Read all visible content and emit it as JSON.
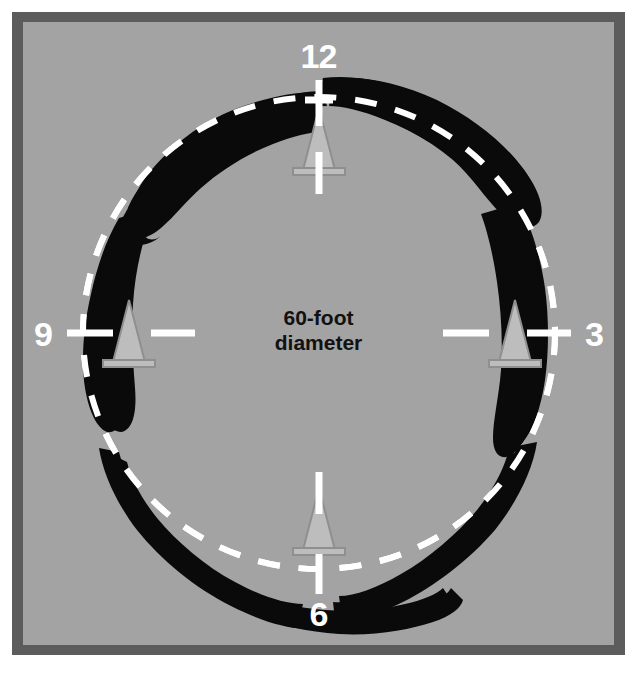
{
  "diagram": {
    "title_text_lines": [
      "60-foot",
      "diameter"
    ],
    "hour_labels": [
      {
        "name": "12",
        "text": "12"
      },
      {
        "name": "3",
        "text": "3"
      },
      {
        "name": "6",
        "text": "6"
      },
      {
        "name": "9",
        "text": "9"
      }
    ],
    "colors": {
      "outer_background": "#ffffff",
      "frame": "#5c5c5c",
      "field": "#a3a3a3",
      "circle_line": "#ffffff",
      "skid_mark": "#0a0a0a",
      "cone": "#b9b9b9",
      "cone_outline": "#8d8d8d",
      "label_text": "#ffffff",
      "caption_text": "#111111"
    },
    "circle": {
      "label": "dashed-circle-path",
      "center_x": 307,
      "center_y": 322,
      "radius": 244,
      "dash": "22 18",
      "stroke_width": 6
    },
    "cones": [
      {
        "name": "cone-12",
        "clock": "12",
        "x": 307,
        "y": 118
      },
      {
        "name": "cone-3",
        "clock": "3",
        "x": 511,
        "y": 322
      },
      {
        "name": "cone-6",
        "clock": "6",
        "x": 307,
        "y": 518
      },
      {
        "name": "cone-9",
        "clock": "9",
        "x": 118,
        "y": 322
      }
    ],
    "ticks": [
      {
        "name": "tick-12",
        "clock": "12",
        "orientation": "vertical"
      },
      {
        "name": "tick-3",
        "clock": "3",
        "orientation": "horizontal"
      },
      {
        "name": "tick-6",
        "clock": "6",
        "orientation": "vertical"
      },
      {
        "name": "tick-9",
        "clock": "9",
        "orientation": "horizontal"
      }
    ],
    "skid_marks": [
      {
        "name": "skid-mark-upper-left",
        "arc": "from 10 o'clock to 12 o'clock"
      },
      {
        "name": "skid-mark-upper-right",
        "arc": "from 12 o'clock to 2 o'clock"
      },
      {
        "name": "skid-mark-left",
        "arc": "from 8 o'clock to 9:30"
      },
      {
        "name": "skid-mark-right",
        "arc": "from 2 o'clock to 3:30"
      },
      {
        "name": "skid-mark-lower-left",
        "arc": "from 7 o'clock to 5 o'clock"
      },
      {
        "name": "skid-mark-lower-right",
        "arc": "from 4 o'clock to 5:30"
      },
      {
        "name": "skid-mark-bottom",
        "arc": "across 6 o'clock"
      }
    ]
  }
}
